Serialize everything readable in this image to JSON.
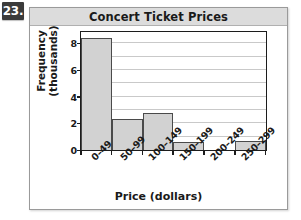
{
  "exercise": {
    "number_label": "23."
  },
  "figure": {
    "panel_background": "#ffffff",
    "panel_border_color": "#9a9a9a",
    "title_bar_color": "#dcdcdc"
  },
  "chart_data": {
    "type": "bar",
    "title": "Concert Ticket Prices",
    "xlabel": "Price (dollars)",
    "ylabel": "Frequency (thousands)",
    "ylabel_lines": [
      "Frequency",
      "(thousands)"
    ],
    "categories": [
      "0–49",
      "50–99",
      "100–149",
      "150–199",
      "200–249",
      "250–299"
    ],
    "values": [
      8.4,
      2.3,
      2.8,
      0.6,
      0.0,
      0.65
    ],
    "ylim": [
      0,
      9.0
    ],
    "ytick_labels": [
      "0",
      "2",
      "4",
      "6",
      "8"
    ],
    "ytick_values": [
      0,
      2,
      4,
      6,
      8
    ],
    "gridlines": [
      1,
      2,
      3,
      4,
      5,
      6,
      7,
      8
    ],
    "grid": true,
    "grid_color": "#c9c9c9",
    "bar_fill": "#d2d2d2",
    "bar_edge": "#4a4a4a",
    "axis_color": "#1c1c1c",
    "legend": null,
    "xtick_rotation": -45
  }
}
